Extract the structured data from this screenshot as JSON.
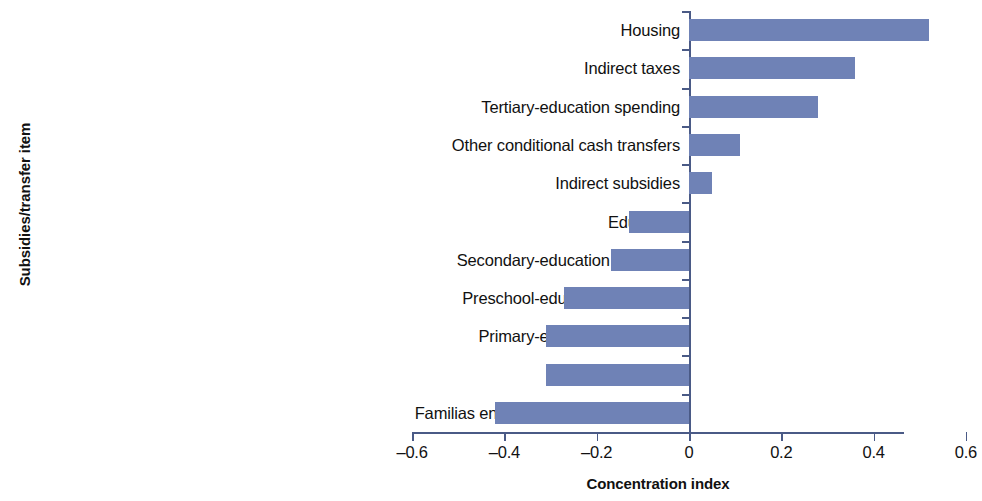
{
  "chart_data": {
    "type": "bar",
    "orientation": "horizontal",
    "title": "",
    "xlabel": "Concentration index",
    "ylabel": "Subsidies/transfer item",
    "xlim": [
      -0.6,
      0.6
    ],
    "xticks": [
      "-0.6",
      "-0.4",
      "-0.2",
      "0",
      "0.2",
      "0.4",
      "0.6"
    ],
    "xtick_values": [
      -0.6,
      -0.4,
      -0.2,
      0,
      0.2,
      0.4,
      0.6
    ],
    "grid": false,
    "legend": null,
    "bar_color": "#6f82b6",
    "axis_color": "#4a5a86",
    "categories": [
      "Housing",
      "Indirect taxes",
      "Tertiary-education spending",
      "Other conditional cash transfers",
      "Indirect subsidies",
      "Education",
      "Secondary-education spending",
      "Preschool-education spending",
      "Primary-education spending",
      "Health",
      "Familias en Acción and Adulto Mayor"
    ],
    "values": [
      0.52,
      0.36,
      0.28,
      0.11,
      0.05,
      -0.13,
      -0.17,
      -0.27,
      -0.31,
      -0.31,
      -0.42
    ]
  }
}
